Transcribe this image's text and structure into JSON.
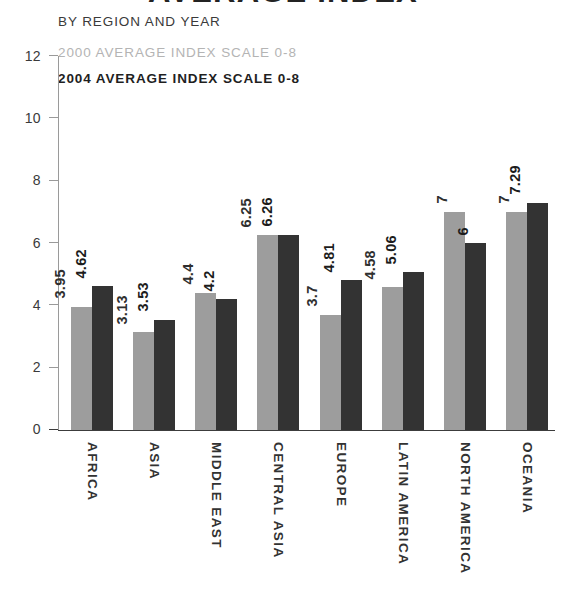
{
  "header": {
    "title": "AVERAGE INDEX",
    "subtitle": "BY REGION AND YEAR"
  },
  "legend": {
    "position": "top-left",
    "items": [
      {
        "label": "2000 AVERAGE INDEX SCALE 0-8",
        "color": "#b4b4b4",
        "series": "2000"
      },
      {
        "label": "2004 AVERAGE INDEX SCALE 0-8",
        "color": "#333333",
        "series": "2004"
      }
    ]
  },
  "axis": {
    "y_ticks": [
      "0",
      "2",
      "4",
      "6",
      "8",
      "10",
      "12"
    ]
  },
  "chart_data": {
    "type": "bar",
    "title": "AVERAGE INDEX",
    "subtitle": "BY REGION AND YEAR",
    "xlabel": "",
    "ylabel": "",
    "ylim": [
      0,
      12
    ],
    "ytick_step": 2,
    "grid": false,
    "legend_position": "top-left",
    "categories": [
      "AFRICA",
      "ASIA",
      "MIDDLE EAST",
      "CENTRAL ASIA",
      "EUROPE",
      "LATIN AMERICA",
      "NORTH AMERICA",
      "OCEANIA"
    ],
    "series": [
      {
        "name": "2000 AVERAGE INDEX SCALE 0-8",
        "color": "#9d9d9d",
        "values": [
          3.95,
          3.13,
          4.4,
          6.25,
          3.7,
          4.58,
          7,
          7
        ],
        "labels": [
          "3.95",
          "3.13",
          "4.4",
          "6.25",
          "3.7",
          "4.58",
          "7",
          "7"
        ]
      },
      {
        "name": "2004 AVERAGE INDEX SCALE 0-8",
        "color": "#333333",
        "values": [
          4.62,
          3.53,
          4.2,
          6.26,
          4.81,
          5.06,
          6,
          7.29
        ],
        "labels": [
          "4.62",
          "3.53",
          "4.2",
          "6.26",
          "4.81",
          "5.06",
          "6",
          "7.29"
        ]
      }
    ]
  },
  "colors": {
    "series_2000": "#9d9d9d",
    "series_2004": "#333333",
    "axis": "#9a9a9a",
    "baseline": "#3c3c3c",
    "background": "#ffffff"
  }
}
